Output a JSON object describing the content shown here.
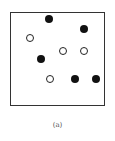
{
  "caption": "(a)",
  "colors": {
    "filled": "#111111",
    "open_border": "#222222",
    "frame": "#333333"
  },
  "points": [
    {
      "type": "filled",
      "x": 49,
      "y": 19
    },
    {
      "type": "filled",
      "x": 84,
      "y": 29
    },
    {
      "type": "open",
      "x": 30,
      "y": 38
    },
    {
      "type": "open",
      "x": 63,
      "y": 51
    },
    {
      "type": "open",
      "x": 84,
      "y": 51
    },
    {
      "type": "filled",
      "x": 41,
      "y": 59
    },
    {
      "type": "open",
      "x": 50,
      "y": 79
    },
    {
      "type": "filled",
      "x": 75,
      "y": 79
    },
    {
      "type": "filled",
      "x": 96,
      "y": 79
    }
  ]
}
